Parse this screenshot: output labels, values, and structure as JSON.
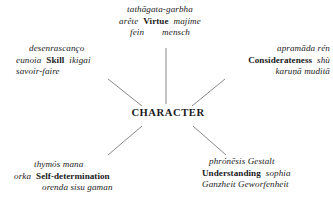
{
  "diagram": {
    "title": "CHARACTER",
    "center": {
      "label": "CHARACTER"
    },
    "clusters": [
      {
        "id": "virtue",
        "core": "Virtue",
        "position": "top",
        "lines": [
          {
            "pre": "",
            "core": "",
            "post": "tathāgata-garbha"
          },
          {
            "pre": "arête",
            "core": "Virtue",
            "post": "majime"
          },
          {
            "pre": "fein",
            "core": "",
            "post": "mensch"
          }
        ],
        "line1": "tathāgata-garbha",
        "line2_pre": "arête",
        "line2_core": "Virtue",
        "line2_post": "majime",
        "line3_pre": "fein",
        "line3_post": "mensch"
      },
      {
        "id": "skill",
        "core": "Skill",
        "position": "upper-left",
        "line1": "desenrascanço",
        "line2_pre": "eunoia",
        "line2_core": "Skill",
        "line2_post": "ikigai",
        "line3": "savoir-faire"
      },
      {
        "id": "considerateness",
        "core": "Considerateness",
        "position": "upper-right",
        "line1": "aprramāda rén",
        "line1_text": "apramāda rén",
        "line2_core": "Considerateness",
        "line2_post": "shù",
        "line3": "karuṇā muditā"
      },
      {
        "id": "self-determination",
        "core": "Self-determination",
        "position": "lower-left",
        "line1": "thymós mana",
        "line2_pre": "orka",
        "line2_core": "Self-determination",
        "line3": "orenda sisu gaman"
      },
      {
        "id": "understanding",
        "core": "Understanding",
        "position": "lower-right",
        "line1": "phrónēsis Gestalt",
        "line2_core": "Understanding",
        "line2_post": "sophia",
        "line3": "Ganzheit Geworfenheit"
      }
    ],
    "colors": {
      "text": "#1a1a1a",
      "connector": "#6b6b6b",
      "background": "#ffffff"
    }
  }
}
